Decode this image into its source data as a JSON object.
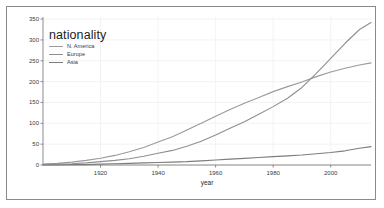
{
  "chart_data": {
    "type": "line",
    "title": "",
    "xlabel": "year",
    "ylabel": "",
    "xlim": [
      1900,
      2014
    ],
    "ylim": [
      0,
      355
    ],
    "grid": true,
    "legend_position": "top-left",
    "legend_title": "nationality",
    "x_ticks": [
      "1920",
      "1940",
      "1960",
      "1980",
      "2000"
    ],
    "x_tick_values": [
      1920,
      1940,
      1960,
      1980,
      2000
    ],
    "y_ticks": [
      "0",
      "50",
      "100",
      "150",
      "200",
      "250",
      "300",
      "350"
    ],
    "y_tick_values": [
      0,
      50,
      100,
      150,
      200,
      250,
      300,
      350
    ],
    "x": [
      1900,
      1905,
      1910,
      1915,
      1920,
      1925,
      1930,
      1935,
      1940,
      1945,
      1950,
      1955,
      1960,
      1965,
      1970,
      1975,
      1980,
      1985,
      1990,
      1995,
      2000,
      2005,
      2010,
      2014
    ],
    "series": [
      {
        "name": "N. America",
        "color": "#9a9a9a",
        "values": [
          2,
          4,
          7,
          11,
          16,
          23,
          32,
          42,
          55,
          68,
          84,
          100,
          117,
          133,
          148,
          162,
          176,
          188,
          199,
          212,
          223,
          232,
          240,
          245
        ]
      },
      {
        "name": "Europe",
        "color": "#8f8f8f",
        "values": [
          1,
          2,
          3,
          5,
          8,
          11,
          15,
          21,
          28,
          35,
          45,
          57,
          72,
          88,
          104,
          122,
          140,
          160,
          186,
          220,
          256,
          292,
          325,
          342
        ]
      },
      {
        "name": "Asia",
        "color": "#7d7d7d",
        "values": [
          0,
          0,
          1,
          1,
          2,
          3,
          4,
          5,
          6,
          7,
          8,
          10,
          12,
          14,
          16,
          18,
          20,
          22,
          24,
          27,
          30,
          34,
          40,
          44
        ]
      }
    ]
  },
  "axes": {
    "x_title": "year"
  },
  "legend": {
    "title": "nationality",
    "entries": [
      {
        "label": "N. America"
      },
      {
        "label": "Europe"
      },
      {
        "label": "Asia"
      }
    ]
  },
  "colors": {
    "frame": "#8a8a8a",
    "axis": "#6e6e6e",
    "grid": "#eeeeee",
    "background": "#ffffff",
    "text": "#3a3a3a"
  }
}
